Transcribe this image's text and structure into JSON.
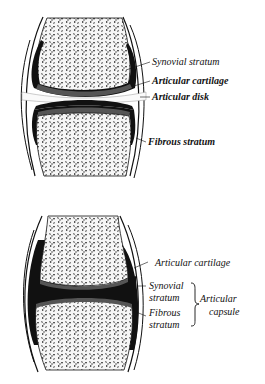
{
  "figures": [
    {
      "id": "top",
      "description": "Joint with articular disk",
      "labels": [
        {
          "text": "Synovial stratum"
        },
        {
          "text": "Articular cartilage"
        },
        {
          "text": "Articular disk"
        },
        {
          "text": "Fibrous stratum"
        }
      ]
    },
    {
      "id": "bottom",
      "description": "Simple synovial joint",
      "labels": [
        {
          "text": "Articular cartilage"
        },
        {
          "text": "Synovial"
        },
        {
          "text": "stratum"
        },
        {
          "text": "Fibrous"
        },
        {
          "text": "stratum"
        }
      ],
      "brace_group": {
        "line1": "Articular",
        "line2": "capsule"
      }
    }
  ],
  "colors": {
    "background": "#ffffff",
    "ink": "#111111",
    "cartilage": "#555555",
    "bone_fill": "#f4f4f4"
  }
}
